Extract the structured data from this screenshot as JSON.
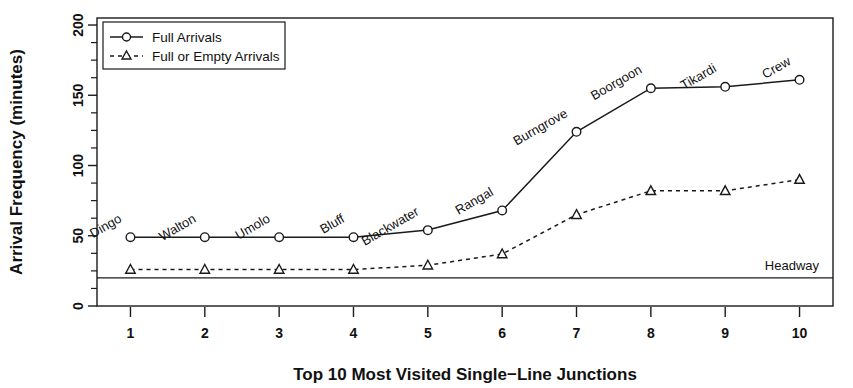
{
  "chart_data": {
    "type": "line",
    "title": "",
    "xlabel": "Top 10 Most Visited Single−Line Junctions",
    "ylabel": "Arrival Frequency (minutes)",
    "x": [
      1,
      2,
      3,
      4,
      5,
      6,
      7,
      8,
      9,
      10
    ],
    "xtick_labels": [
      "1",
      "2",
      "3",
      "4",
      "5",
      "6",
      "7",
      "8",
      "9",
      "10"
    ],
    "ytick_labels": [
      "0",
      "50",
      "100",
      "150",
      "200"
    ],
    "ytick_values": [
      0,
      50,
      100,
      150,
      200
    ],
    "yminor_values": [
      12.5,
      25,
      37.5,
      62.5,
      75,
      87.5,
      112.5,
      125,
      137.5,
      162.5,
      175,
      187.5
    ],
    "xlim": [
      0.55,
      10.45
    ],
    "ylim": [
      0,
      205
    ],
    "grid": false,
    "legend_position": "top-left",
    "point_labels": [
      "Dingo",
      "Walton",
      "Umolo",
      "Bluff",
      "Blackwater",
      "Rangal",
      "Burngrove",
      "Boorgoon",
      "Tikardi",
      "Crew"
    ],
    "series": [
      {
        "name": "Full Arrivals",
        "marker": "circle",
        "linestyle": "solid",
        "values": [
          49,
          49,
          49,
          49,
          54,
          68,
          124,
          155,
          156,
          161
        ]
      },
      {
        "name": "Full or Empty Arrivals",
        "marker": "triangle",
        "linestyle": "dashed",
        "values": [
          26,
          26,
          26,
          26,
          29,
          37,
          65,
          82,
          82,
          90
        ]
      }
    ],
    "annotations": [
      {
        "name": "headway-reference-line",
        "label": "Headway",
        "value": 20,
        "type": "hline"
      }
    ]
  },
  "legend": {
    "entries": [
      {
        "label": "Full Arrivals",
        "marker": "circle",
        "linestyle": "solid"
      },
      {
        "label": "Full or Empty Arrivals",
        "marker": "triangle",
        "linestyle": "dashed"
      }
    ]
  },
  "colors": {
    "foreground": "#1a1a1a",
    "background": "#ffffff"
  }
}
